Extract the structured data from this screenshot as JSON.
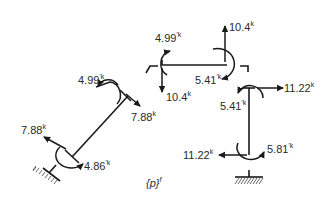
{
  "diagram": {
    "title": "{p}",
    "title_superscript": "f",
    "colors": {
      "ink": "#1a1a1a",
      "background": "#ffffff"
    },
    "members": [
      {
        "name": "left-inclined-column"
      },
      {
        "name": "beam"
      },
      {
        "name": "right-column"
      }
    ],
    "supports": [
      {
        "name": "left-fixed-support"
      },
      {
        "name": "right-fixed-support"
      }
    ],
    "loads": [
      {
        "id": "left-base-force",
        "value": "7.88",
        "unit": "k"
      },
      {
        "id": "left-base-moment",
        "value": "4.86",
        "unit": "'k"
      },
      {
        "id": "left-top-moment",
        "value": "4.99",
        "unit": "'k"
      },
      {
        "id": "left-top-force",
        "value": "7.88",
        "unit": "k"
      },
      {
        "id": "beam-left-moment",
        "value": "4.99",
        "unit": "'k"
      },
      {
        "id": "beam-left-shear",
        "value": "10.4",
        "unit": "k"
      },
      {
        "id": "beam-right-shear",
        "value": "10.4",
        "unit": "k"
      },
      {
        "id": "beam-right-moment",
        "value": "5.41",
        "unit": "'k"
      },
      {
        "id": "right-top-force",
        "value": "11.22",
        "unit": "k"
      },
      {
        "id": "right-top-moment",
        "value": "5.41",
        "unit": "'k"
      },
      {
        "id": "right-base-force",
        "value": "11.22",
        "unit": "k"
      },
      {
        "id": "right-base-moment",
        "value": "5.81",
        "unit": "'k"
      }
    ]
  }
}
